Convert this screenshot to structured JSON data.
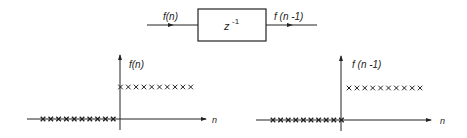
{
  "block_diagram": {
    "input_label": "f(n)",
    "output_label": "f (n -1)",
    "block_label_base": "z",
    "block_label_exp": "-1"
  },
  "plot_left": {
    "y_label": "f(n)",
    "x_label": "n",
    "description": "unit step: 0 for n<0, 1 for n>=0"
  },
  "plot_right": {
    "y_label": "f (n -1)",
    "x_label": "n",
    "description": "delayed unit step: 0 for n<=0, 1 for n>=1"
  },
  "colors": {
    "ink": "#222222",
    "background": "#ffffff"
  }
}
